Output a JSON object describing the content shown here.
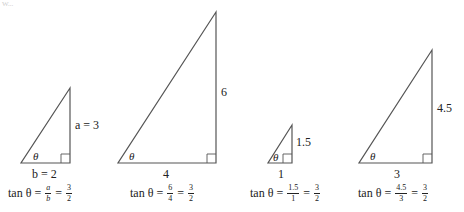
{
  "header_fragment": "W...",
  "triangles": [
    {
      "id": 1,
      "apex": [
        70,
        88
      ],
      "base_left": [
        21,
        163
      ],
      "base_right": [
        70,
        163
      ],
      "angle_label": "θ",
      "opposite_label": "a = 3",
      "adjacent_label": "b = 2",
      "formula": {
        "lhs": "tan θ",
        "eq": "=",
        "f1_num": "a",
        "f1_den": "b",
        "f2_num": "3",
        "f2_den": "2"
      }
    },
    {
      "id": 2,
      "apex": [
        216,
        12
      ],
      "base_left": [
        118,
        163
      ],
      "base_right": [
        216,
        163
      ],
      "angle_label": "θ",
      "opposite_label": "6",
      "adjacent_label": "4",
      "formula": {
        "lhs": "tan θ",
        "eq": "=",
        "f1_num": "6",
        "f1_den": "4",
        "f2_num": "3",
        "f2_den": "2"
      }
    },
    {
      "id": 3,
      "apex": [
        292,
        125
      ],
      "base_left": [
        268,
        163
      ],
      "base_right": [
        292,
        163
      ],
      "angle_label": "θ",
      "opposite_label": "1.5",
      "adjacent_label": "1",
      "formula": {
        "lhs": "tan θ",
        "eq": "=",
        "f1_num": "1.5",
        "f1_den": "1",
        "f2_num": "3",
        "f2_den": "2"
      }
    },
    {
      "id": 4,
      "apex": [
        432,
        50
      ],
      "base_left": [
        359,
        163
      ],
      "base_right": [
        432,
        163
      ],
      "angle_label": "θ",
      "opposite_label": "4.5",
      "adjacent_label": "3",
      "formula": {
        "lhs": "tan θ",
        "eq": "=",
        "f1_num": "4.5",
        "f1_den": "3",
        "f2_num": "3",
        "f2_den": "2"
      }
    }
  ],
  "colors": {
    "line": "#555555",
    "text": "#222222"
  }
}
